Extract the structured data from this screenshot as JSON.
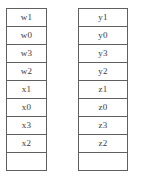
{
  "diagram": {
    "background_color": "#ffffff",
    "border_color": "#5f5f5f",
    "text_color": "#3a3a3a",
    "columns": [
      {
        "name": "left-stack",
        "cells": [
          {
            "label": "w1",
            "empty": false
          },
          {
            "label": "w0",
            "empty": false
          },
          {
            "label": "w3",
            "empty": false
          },
          {
            "label": "w2",
            "empty": false
          },
          {
            "label": "x1",
            "empty": false
          },
          {
            "label": "x0",
            "empty": false
          },
          {
            "label": "x3",
            "empty": false
          },
          {
            "label": "x2",
            "empty": false
          },
          {
            "label": "",
            "empty": true
          }
        ]
      },
      {
        "name": "right-stack",
        "cells": [
          {
            "label": "y1",
            "empty": false
          },
          {
            "label": "y0",
            "empty": false
          },
          {
            "label": "y3",
            "empty": false
          },
          {
            "label": "y2",
            "empty": false
          },
          {
            "label": "z1",
            "empty": false
          },
          {
            "label": "z0",
            "empty": false
          },
          {
            "label": "z3",
            "empty": false
          },
          {
            "label": "z2",
            "empty": false
          },
          {
            "label": "",
            "empty": true
          }
        ]
      }
    ]
  }
}
